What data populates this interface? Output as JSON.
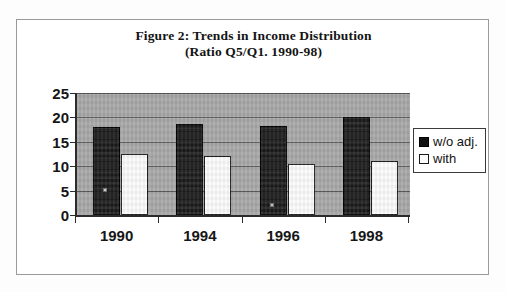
{
  "chart_data": {
    "type": "bar",
    "title": "Figure 2: Trends in Income Distribution",
    "subtitle": "(Ratio Q5/Q1. 1990-98)",
    "xlabel": "",
    "ylabel": "",
    "ylim": [
      0,
      25
    ],
    "yticks": [
      0,
      5,
      10,
      15,
      20,
      25
    ],
    "ytick_labels": [
      "0",
      "5",
      "10",
      "15",
      "20",
      "25"
    ],
    "grid": true,
    "grid_axis": "y",
    "legend_position": "right",
    "categories": [
      "1990",
      "1994",
      "1996",
      "1998"
    ],
    "series": [
      {
        "name": "w/o adj.",
        "color": "#111111",
        "values": [
          18.0,
          18.7,
          18.3,
          20.0
        ]
      },
      {
        "name": "with",
        "color": "#ffffff",
        "values": [
          12.5,
          12.0,
          10.5,
          11.0
        ]
      }
    ]
  },
  "legend": {
    "items": [
      {
        "label": "w/o adj.",
        "swatch": "filled-square-icon"
      },
      {
        "label": "with",
        "swatch": "hollow-square-icon"
      }
    ]
  },
  "colors": {
    "plot_background": "#a8a8a8",
    "axis": "#2b2b2b",
    "gridline": "#4a4a4a",
    "series_dark": "#111111",
    "series_light": "#ffffff",
    "page": "#ffffff"
  }
}
